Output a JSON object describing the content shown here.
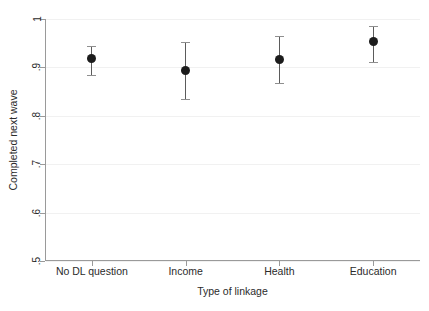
{
  "chart_data": {
    "type": "scatter",
    "title": "",
    "xlabel": "Type of linkage",
    "ylabel": "Completed next wave",
    "categories": [
      "No DL question",
      "Income",
      "Health",
      "Education"
    ],
    "values": [
      0.918,
      0.894,
      0.917,
      0.953
    ],
    "error_low": [
      0.884,
      0.835,
      0.868,
      0.912
    ],
    "error_high": [
      0.944,
      0.952,
      0.964,
      0.986
    ],
    "ylim": [
      0.5,
      1.0
    ],
    "yticks": [
      0.5,
      0.6,
      0.7,
      0.8,
      0.9,
      1.0
    ],
    "ytick_labels": [
      ".5",
      ".6",
      ".7",
      ".8",
      ".9",
      "1"
    ],
    "grid": true,
    "legend": "none",
    "marker_color": "#1c1c1c",
    "error_bar_color": "#5b5b5b",
    "gridline_color": "#f1f1f1",
    "axis_color": "#9a9a9a",
    "series": [
      {
        "name": "Completed next wave",
        "points": [
          {
            "category": "No DL question",
            "value": 0.918,
            "low": 0.884,
            "high": 0.944
          },
          {
            "category": "Income",
            "value": 0.894,
            "low": 0.835,
            "high": 0.952
          },
          {
            "category": "Health",
            "value": 0.917,
            "low": 0.868,
            "high": 0.964
          },
          {
            "category": "Education",
            "value": 0.953,
            "low": 0.912,
            "high": 0.986
          }
        ]
      }
    ]
  }
}
